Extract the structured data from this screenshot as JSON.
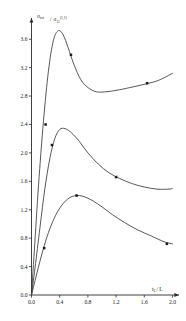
{
  "figure": {
    "background": "#ffffff",
    "ink_color": "#2b2b2b",
    "curve_color": "#3a3a3a"
  },
  "axes": {
    "y_label_numerator": "σ",
    "y_label_numerator_sub": "tot",
    "y_label_denominator": "σ",
    "y_label_denominator_sub": "11",
    "y_label_denominator_sup": "(1,1)",
    "y_label_plain": "σtot / σ11^(1,1)",
    "x_label_main": "t",
    "x_label_sub": "L",
    "x_label_tail": "/ L",
    "x_label_plain": "tL / L",
    "x_ticks": [
      "0.0",
      "0.4",
      "0.8",
      "1.2",
      "1.6",
      "2.0"
    ],
    "y_ticks": [
      "0.0",
      "0.4",
      "0.8",
      "1.2",
      "1.6",
      "2.0",
      "2.4",
      "2.8",
      "3.2",
      "3.6"
    ],
    "x_min": 0.0,
    "x_max": 2.05,
    "y_min": 0.0,
    "y_max": 3.8,
    "grid": false,
    "x_arrow": true,
    "y_arrow": true
  },
  "chart_data": {
    "type": "line",
    "title": "",
    "xlabel": "tL / L",
    "ylabel": "σtot / σ11^(1,1)",
    "xlim": [
      0.0,
      2.05
    ],
    "ylim": [
      0.0,
      3.8
    ],
    "xticks": [
      0.0,
      0.4,
      0.8,
      1.2,
      1.6,
      2.0
    ],
    "yticks": [
      0.0,
      0.4,
      0.8,
      1.2,
      1.6,
      2.0,
      2.4,
      2.8,
      3.2,
      3.6
    ],
    "grid": false,
    "legend": false,
    "series": [
      {
        "name": "upper-curve",
        "x": [
          0.0,
          0.04,
          0.1,
          0.17,
          0.24,
          0.31,
          0.38,
          0.45,
          0.52,
          0.6,
          0.7,
          0.8,
          0.92,
          1.05,
          1.2,
          1.4,
          1.62,
          1.8,
          2.0
        ],
        "y": [
          0.0,
          0.62,
          1.55,
          2.45,
          3.15,
          3.58,
          3.72,
          3.66,
          3.48,
          3.25,
          3.03,
          2.92,
          2.86,
          2.86,
          2.88,
          2.92,
          2.97,
          3.02,
          3.12
        ],
        "markers": [
          {
            "x": 0.2,
            "y": 2.4
          },
          {
            "x": 0.56,
            "y": 3.38
          },
          {
            "x": 1.64,
            "y": 2.98
          }
        ]
      },
      {
        "name": "middle-curve",
        "x": [
          0.0,
          0.05,
          0.12,
          0.19,
          0.26,
          0.33,
          0.4,
          0.48,
          0.57,
          0.68,
          0.8,
          0.95,
          1.1,
          1.25,
          1.42,
          1.6,
          1.78,
          1.95,
          2.0
        ],
        "y": [
          0.0,
          0.38,
          0.95,
          1.5,
          1.92,
          2.2,
          2.33,
          2.34,
          2.28,
          2.16,
          2.0,
          1.84,
          1.72,
          1.64,
          1.57,
          1.52,
          1.49,
          1.49,
          1.5
        ],
        "markers": [
          {
            "x": 0.29,
            "y": 2.11
          },
          {
            "x": 1.2,
            "y": 1.66
          }
        ]
      },
      {
        "name": "lower-curve",
        "x": [
          0.0,
          0.06,
          0.14,
          0.22,
          0.3,
          0.38,
          0.47,
          0.56,
          0.66,
          0.76,
          0.88,
          1.0,
          1.15,
          1.32,
          1.5,
          1.7,
          1.88,
          2.0
        ],
        "y": [
          0.0,
          0.24,
          0.55,
          0.82,
          1.03,
          1.19,
          1.31,
          1.38,
          1.4,
          1.38,
          1.32,
          1.24,
          1.13,
          1.02,
          0.92,
          0.83,
          0.75,
          0.72
        ],
        "markers": [
          {
            "x": 0.18,
            "y": 0.66
          },
          {
            "x": 0.64,
            "y": 1.4
          },
          {
            "x": 1.92,
            "y": 0.72
          }
        ]
      }
    ]
  }
}
